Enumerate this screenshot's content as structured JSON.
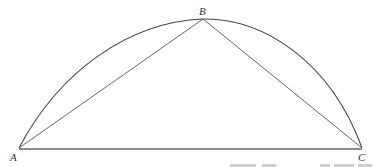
{
  "diagram": {
    "type": "geometry",
    "points": [
      {
        "label": "A",
        "x": 19,
        "y": 148
      },
      {
        "label": "B",
        "x": 203,
        "y": 19
      },
      {
        "label": "C",
        "x": 362,
        "y": 148
      }
    ],
    "segments": [
      "AB",
      "BC",
      "AC"
    ],
    "curve": {
      "from": "A",
      "through": "B",
      "to": "C",
      "kind": "arc"
    },
    "colors": {
      "line": "#555555",
      "background": "#ffffff"
    }
  }
}
